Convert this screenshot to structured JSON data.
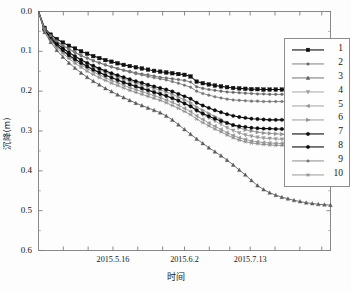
{
  "chart_data": {
    "type": "line",
    "title": "",
    "xlabel": "时间",
    "ylabel": "沉降(m)",
    "y_inverted": true,
    "ylim": [
      0.0,
      0.6
    ],
    "yticks": [
      "0.0",
      "0.1",
      "0.2",
      "0.3",
      "0.4",
      "0.5",
      "0.6"
    ],
    "ytick_values": [
      0.0,
      0.1,
      0.2,
      0.3,
      0.4,
      0.5,
      0.6
    ],
    "grid": false,
    "legend_position": "upper-right",
    "xtick_labels": [
      "2015.5.16",
      "2015.6.2",
      "2015.7.13"
    ],
    "xtick_label_positions": [
      0.255,
      0.5,
      0.725
    ],
    "x_index_range": [
      0,
      48
    ],
    "legend_entries": [
      "1",
      "2",
      "3",
      "4",
      "5",
      "6",
      "7",
      "8",
      "9",
      "10"
    ],
    "series": [
      {
        "name": "1",
        "marker": "square",
        "color": "#101010",
        "values": [
          0.0,
          0.041,
          0.058,
          0.069,
          0.078,
          0.086,
          0.093,
          0.1,
          0.106,
          0.112,
          0.117,
          0.122,
          0.126,
          0.13,
          0.134,
          0.137,
          0.14,
          0.143,
          0.146,
          0.149,
          0.151,
          0.153,
          0.155,
          0.157,
          0.159,
          0.163,
          0.176,
          0.18,
          0.183,
          0.186,
          0.188,
          0.19,
          0.192,
          0.193,
          0.194,
          0.195,
          0.195,
          0.196,
          0.196,
          0.196,
          0.196,
          0.196,
          0.196,
          0.196,
          0.196,
          0.196,
          0.196,
          0.196,
          0.196
        ]
      },
      {
        "name": "2",
        "marker": "circle-small",
        "color": "#6a6a6a",
        "values": [
          0.0,
          0.044,
          0.062,
          0.075,
          0.086,
          0.095,
          0.103,
          0.111,
          0.117,
          0.124,
          0.129,
          0.134,
          0.139,
          0.143,
          0.147,
          0.15,
          0.154,
          0.157,
          0.159,
          0.162,
          0.165,
          0.167,
          0.169,
          0.171,
          0.173,
          0.177,
          0.189,
          0.193,
          0.196,
          0.198,
          0.2,
          0.202,
          0.203,
          0.204,
          0.205,
          0.206,
          0.207,
          0.207,
          0.208,
          0.208,
          0.208,
          0.208,
          0.208,
          0.208,
          0.208,
          0.208,
          0.208,
          0.208,
          0.208
        ]
      },
      {
        "name": "3",
        "marker": "triangle",
        "color": "#5c5c5c",
        "values": [
          0.0,
          0.052,
          0.077,
          0.097,
          0.114,
          0.129,
          0.142,
          0.154,
          0.165,
          0.175,
          0.184,
          0.193,
          0.201,
          0.209,
          0.216,
          0.223,
          0.23,
          0.236,
          0.242,
          0.248,
          0.254,
          0.262,
          0.272,
          0.284,
          0.296,
          0.308,
          0.32,
          0.331,
          0.342,
          0.352,
          0.362,
          0.373,
          0.385,
          0.398,
          0.41,
          0.424,
          0.437,
          0.447,
          0.455,
          0.461,
          0.466,
          0.47,
          0.474,
          0.477,
          0.48,
          0.482,
          0.484,
          0.485,
          0.486
        ]
      },
      {
        "name": "4",
        "marker": "triangle-down",
        "color": "#9a9a9a",
        "values": [
          0.0,
          0.047,
          0.068,
          0.084,
          0.097,
          0.109,
          0.119,
          0.128,
          0.137,
          0.145,
          0.152,
          0.159,
          0.165,
          0.171,
          0.177,
          0.182,
          0.187,
          0.192,
          0.197,
          0.201,
          0.206,
          0.211,
          0.217,
          0.224,
          0.231,
          0.239,
          0.25,
          0.259,
          0.267,
          0.275,
          0.283,
          0.292,
          0.299,
          0.305,
          0.31,
          0.313,
          0.316,
          0.318,
          0.319,
          0.32,
          0.321,
          0.321,
          0.322,
          0.322,
          0.322,
          0.322,
          0.322,
          0.322,
          0.322
        ]
      },
      {
        "name": "5",
        "marker": "triangle-left",
        "color": "#949494",
        "values": [
          0.0,
          0.048,
          0.07,
          0.087,
          0.101,
          0.113,
          0.124,
          0.134,
          0.143,
          0.151,
          0.159,
          0.166,
          0.173,
          0.179,
          0.185,
          0.191,
          0.196,
          0.201,
          0.206,
          0.211,
          0.216,
          0.222,
          0.228,
          0.235,
          0.243,
          0.251,
          0.262,
          0.271,
          0.28,
          0.288,
          0.296,
          0.304,
          0.311,
          0.317,
          0.321,
          0.325,
          0.327,
          0.329,
          0.33,
          0.331,
          0.331,
          0.332,
          0.332,
          0.332,
          0.332,
          0.332,
          0.332,
          0.332,
          0.332
        ]
      },
      {
        "name": "6",
        "marker": "triangle-right",
        "color": "#8e8e8e",
        "values": [
          0.0,
          0.046,
          0.066,
          0.081,
          0.093,
          0.104,
          0.114,
          0.123,
          0.131,
          0.139,
          0.146,
          0.152,
          0.158,
          0.164,
          0.169,
          0.174,
          0.179,
          0.184,
          0.188,
          0.193,
          0.197,
          0.202,
          0.208,
          0.215,
          0.222,
          0.229,
          0.24,
          0.248,
          0.256,
          0.264,
          0.271,
          0.279,
          0.286,
          0.292,
          0.297,
          0.3,
          0.303,
          0.305,
          0.306,
          0.307,
          0.308,
          0.308,
          0.309,
          0.309,
          0.309,
          0.309,
          0.309,
          0.309,
          0.309
        ]
      },
      {
        "name": "7",
        "marker": "circle",
        "color": "#0d0d0d",
        "values": [
          0.0,
          0.045,
          0.065,
          0.08,
          0.092,
          0.103,
          0.112,
          0.121,
          0.129,
          0.136,
          0.143,
          0.149,
          0.155,
          0.16,
          0.165,
          0.17,
          0.175,
          0.179,
          0.184,
          0.188,
          0.192,
          0.196,
          0.201,
          0.207,
          0.213,
          0.219,
          0.229,
          0.236,
          0.242,
          0.248,
          0.253,
          0.258,
          0.262,
          0.265,
          0.267,
          0.269,
          0.27,
          0.271,
          0.272,
          0.272,
          0.272,
          0.272,
          0.272,
          0.272,
          0.272,
          0.272,
          0.272,
          0.272,
          0.272
        ]
      },
      {
        "name": "8",
        "marker": "circle",
        "color": "#0d0d0d",
        "values": [
          0.0,
          0.047,
          0.068,
          0.085,
          0.098,
          0.11,
          0.12,
          0.129,
          0.138,
          0.146,
          0.153,
          0.16,
          0.166,
          0.172,
          0.178,
          0.183,
          0.188,
          0.193,
          0.198,
          0.203,
          0.207,
          0.212,
          0.218,
          0.224,
          0.231,
          0.238,
          0.248,
          0.256,
          0.263,
          0.269,
          0.275,
          0.28,
          0.285,
          0.288,
          0.29,
          0.292,
          0.293,
          0.294,
          0.294,
          0.295,
          0.295,
          0.295,
          0.295,
          0.295,
          0.295,
          0.295,
          0.295,
          0.295,
          0.295
        ]
      },
      {
        "name": "9",
        "marker": "circle-small",
        "color": "#787878",
        "values": [
          0.0,
          0.043,
          0.061,
          0.074,
          0.085,
          0.094,
          0.102,
          0.11,
          0.117,
          0.123,
          0.129,
          0.134,
          0.139,
          0.144,
          0.148,
          0.152,
          0.156,
          0.159,
          0.163,
          0.166,
          0.169,
          0.172,
          0.176,
          0.18,
          0.185,
          0.19,
          0.2,
          0.206,
          0.21,
          0.214,
          0.217,
          0.22,
          0.222,
          0.223,
          0.224,
          0.225,
          0.225,
          0.226,
          0.226,
          0.226,
          0.226,
          0.226,
          0.226,
          0.226,
          0.226,
          0.226,
          0.226,
          0.226,
          0.226
        ]
      },
      {
        "name": "10",
        "marker": "asterisk",
        "color": "#8a8a8a",
        "values": [
          0.0,
          0.049,
          0.072,
          0.09,
          0.105,
          0.118,
          0.13,
          0.14,
          0.15,
          0.158,
          0.166,
          0.173,
          0.18,
          0.186,
          0.192,
          0.198,
          0.203,
          0.208,
          0.213,
          0.218,
          0.223,
          0.229,
          0.236,
          0.243,
          0.251,
          0.259,
          0.27,
          0.279,
          0.287,
          0.295,
          0.302,
          0.31,
          0.317,
          0.323,
          0.327,
          0.33,
          0.332,
          0.334,
          0.335,
          0.336,
          0.336,
          0.337,
          0.337,
          0.337,
          0.337,
          0.337,
          0.337,
          0.337,
          0.337
        ]
      }
    ]
  }
}
